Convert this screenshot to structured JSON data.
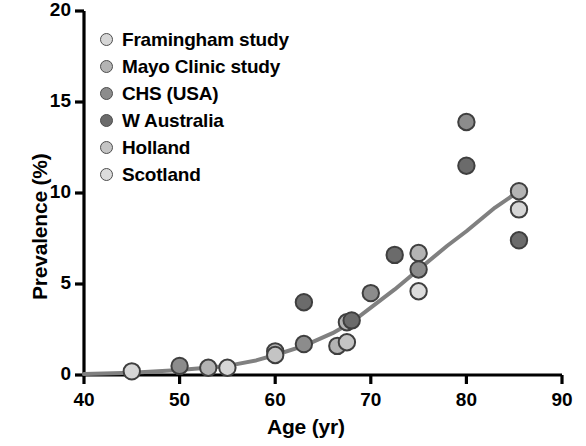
{
  "chart_data": {
    "type": "scatter",
    "title": "",
    "xlabel": "Age (yr)",
    "ylabel": "Prevalence (%)",
    "xlim": [
      40,
      90
    ],
    "ylim": [
      0,
      20
    ],
    "xticks": [
      40,
      50,
      60,
      70,
      80,
      90
    ],
    "yticks": [
      0,
      5,
      10,
      15,
      20
    ],
    "xtick_labels": [
      "40",
      "50",
      "60",
      "70",
      "80",
      "90"
    ],
    "ytick_labels": [
      "0",
      "5",
      "10",
      "15",
      "20"
    ],
    "grid": false,
    "legend_position": "top-left",
    "series": [
      {
        "name": "Framingham study",
        "color": "#d6d6d6",
        "points": [
          {
            "x": 45,
            "y": 0.2
          },
          {
            "x": 55,
            "y": 0.4
          },
          {
            "x": 85.5,
            "y": 9.1
          }
        ]
      },
      {
        "name": "Mayo Clinic study",
        "color": "#b3b3b3",
        "points": [
          {
            "x": 53,
            "y": 0.4
          },
          {
            "x": 60,
            "y": 1.3
          },
          {
            "x": 66.5,
            "y": 1.6
          },
          {
            "x": 67.5,
            "y": 2.9
          },
          {
            "x": 75,
            "y": 6.7
          },
          {
            "x": 85.5,
            "y": 10.1
          }
        ]
      },
      {
        "name": "CHS (USA)",
        "color": "#8c8c8c",
        "points": [
          {
            "x": 50,
            "y": 0.5
          },
          {
            "x": 63,
            "y": 1.7
          },
          {
            "x": 70,
            "y": 4.5
          },
          {
            "x": 75,
            "y": 5.8
          },
          {
            "x": 80,
            "y": 13.9
          }
        ]
      },
      {
        "name": "W Australia",
        "color": "#6b6b6b",
        "points": [
          {
            "x": 63,
            "y": 4.0
          },
          {
            "x": 68,
            "y": 3.0
          },
          {
            "x": 72.5,
            "y": 6.6
          },
          {
            "x": 80,
            "y": 11.5
          },
          {
            "x": 85.5,
            "y": 7.4
          }
        ]
      },
      {
        "name": "Holland",
        "color": "#c4c4c4",
        "points": [
          {
            "x": 60,
            "y": 1.1
          },
          {
            "x": 67.5,
            "y": 1.8
          }
        ]
      },
      {
        "name": "Scotland",
        "color": "#dcdcdc",
        "points": [
          {
            "x": 75,
            "y": 4.6
          }
        ]
      }
    ],
    "trend_line": {
      "name": "fitted curve",
      "color": "#808080",
      "points": [
        {
          "x": 40,
          "y": 0.05
        },
        {
          "x": 45,
          "y": 0.12
        },
        {
          "x": 50,
          "y": 0.28
        },
        {
          "x": 55,
          "y": 0.5
        },
        {
          "x": 58,
          "y": 0.8
        },
        {
          "x": 60,
          "y": 1.1
        },
        {
          "x": 63,
          "y": 1.6
        },
        {
          "x": 66,
          "y": 2.3
        },
        {
          "x": 68,
          "y": 2.9
        },
        {
          "x": 70,
          "y": 3.7
        },
        {
          "x": 72.5,
          "y": 4.7
        },
        {
          "x": 75,
          "y": 5.8
        },
        {
          "x": 78,
          "y": 7.1
        },
        {
          "x": 80,
          "y": 7.9
        },
        {
          "x": 83,
          "y": 9.2
        },
        {
          "x": 85.5,
          "y": 10.1
        }
      ]
    }
  },
  "legend": {
    "items": [
      {
        "label": "Framingham study",
        "color": "#d6d6d6"
      },
      {
        "label": "Mayo Clinic study",
        "color": "#b3b3b3"
      },
      {
        "label": "CHS (USA)",
        "color": "#8c8c8c"
      },
      {
        "label": "W Australia",
        "color": "#6b6b6b"
      },
      {
        "label": "Holland",
        "color": "#c4c4c4"
      },
      {
        "label": "Scotland",
        "color": "#dcdcdc"
      }
    ]
  }
}
